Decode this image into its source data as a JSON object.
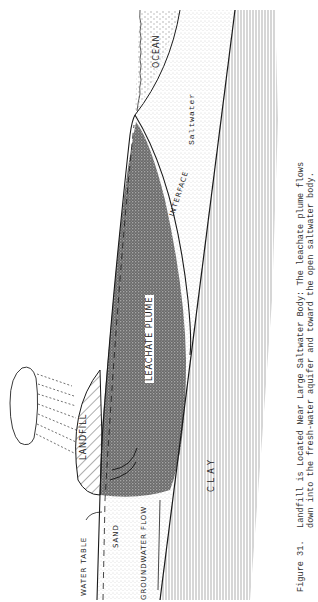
{
  "figure": {
    "number": "Figure 31.",
    "caption_line1": "Landfill is Located Near Large Saltwater  Body:  The leachate plume flows",
    "caption_line2": "down into the fresh-water aquifer and toward the open saltwater  body."
  },
  "labels": {
    "ocean": "OCEAN",
    "saltwater": "Saltwater",
    "interface": "INTERFACE",
    "leachate_plume": "LEACHATE PLUME",
    "landfill": "LANDFILL",
    "water_table": "WATER TABLE",
    "sand": "SAND",
    "groundwater_flow": "GROUNDWATER FLOW",
    "clay": "CLAY"
  },
  "colors": {
    "ink": "#1a1a1a",
    "paper": "#ffffff",
    "stipple": "#777777"
  }
}
